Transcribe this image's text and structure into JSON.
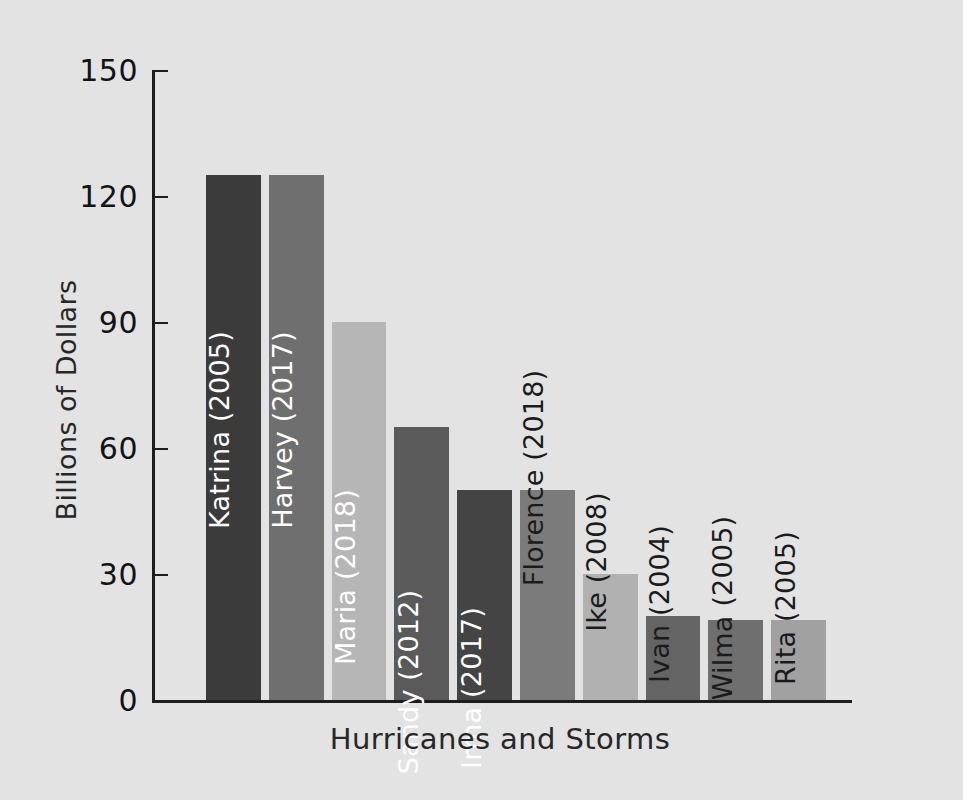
{
  "chart_data": {
    "type": "bar",
    "title": "",
    "xlabel": "Hurricanes and Storms",
    "ylabel": "Billions of Dollars",
    "ylim": [
      0,
      150
    ],
    "yticks": [
      0,
      30,
      60,
      90,
      120,
      150
    ],
    "ytick_labels": [
      "0",
      "30",
      "60",
      "90",
      "120",
      "150"
    ],
    "grid": false,
    "legend": "none",
    "categories": [
      "Katrina (2005)",
      "Harvey (2017)",
      "Maria (2018)",
      "Sandy (2012)",
      "Irma (2017)",
      "Florence (2018)",
      "Ike (2008)",
      "Ivan (2004)",
      "Wilma (2005)",
      "Rita (2005)"
    ],
    "values": [
      125,
      125,
      90,
      65,
      50,
      50,
      30,
      20,
      19,
      19
    ],
    "bar_colors": [
      "#3b3b3b",
      "#6f6f6f",
      "#b6b6b6",
      "#5a5a5a",
      "#444444",
      "#7b7b7b",
      "#b1b1b1",
      "#646464",
      "#6f6f6f",
      "#a1a1a1"
    ],
    "label_placement": [
      "inside",
      "inside",
      "inside",
      "inside",
      "inside",
      "outside",
      "outside",
      "outside",
      "outside",
      "outside"
    ],
    "bars": [
      {
        "category": "Katrina (2005)",
        "value": 125,
        "color": "#3b3b3b",
        "label_placement": "inside"
      },
      {
        "category": "Harvey (2017)",
        "value": 125,
        "color": "#6f6f6f",
        "label_placement": "inside"
      },
      {
        "category": "Maria (2018)",
        "value": 90,
        "color": "#b6b6b6",
        "label_placement": "inside"
      },
      {
        "category": "Sandy (2012)",
        "value": 65,
        "color": "#5a5a5a",
        "label_placement": "inside"
      },
      {
        "category": "Irma (2017)",
        "value": 50,
        "color": "#444444",
        "label_placement": "inside"
      },
      {
        "category": "Florence (2018)",
        "value": 50,
        "color": "#7b7b7b",
        "label_placement": "outside"
      },
      {
        "category": "Ike (2008)",
        "value": 30,
        "color": "#b1b1b1",
        "label_placement": "outside"
      },
      {
        "category": "Ivan (2004)",
        "value": 20,
        "color": "#646464",
        "label_placement": "outside"
      },
      {
        "category": "Wilma (2005)",
        "value": 19,
        "color": "#6f6f6f",
        "label_placement": "outside"
      },
      {
        "category": "Rita (2005)",
        "value": 19,
        "color": "#a1a1a1",
        "label_placement": "outside"
      }
    ],
    "background_color": "#e3e3e3",
    "axis_color": "#1d1d1d",
    "text_color": "#1b1b1b"
  }
}
